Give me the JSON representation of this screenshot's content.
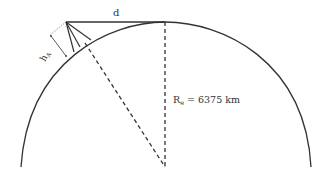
{
  "diagram": {
    "labels": {
      "distance": "d",
      "height_main": "h",
      "height_sub": "A",
      "radius_main": "R",
      "radius_sub": "e",
      "radius_value": "= 6375 km"
    },
    "colors": {
      "stroke": "#333333",
      "background": "#ffffff"
    }
  }
}
